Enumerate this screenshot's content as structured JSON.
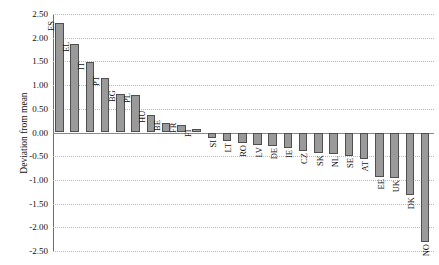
{
  "chart_data": {
    "type": "bar",
    "title": "",
    "xlabel": "",
    "ylabel": "Deviation from mean",
    "ylim": [
      -2.5,
      2.5
    ],
    "ytick_labels": [
      "2.50",
      "2.00",
      "1.50",
      "1.00",
      "0.50",
      "0.00",
      "-0.50",
      "-1.00",
      "-1.50",
      "-2.00",
      "-2.50"
    ],
    "ytick_values": [
      2.5,
      2.0,
      1.5,
      1.0,
      0.5,
      0.0,
      -0.5,
      -1.0,
      -1.5,
      -2.0,
      -2.5
    ],
    "grid": true,
    "legend": "none",
    "categories": [
      "ES",
      "EL",
      "IT",
      "PT",
      "BG",
      "PL",
      "HU",
      "BE",
      "FR",
      "FI",
      "SI",
      "LT",
      "RO",
      "LV",
      "DE",
      "IE",
      "CZ",
      "SK",
      "NL",
      "SE",
      "AT",
      "EE",
      "UK",
      "DK",
      "NO"
    ],
    "values": [
      2.32,
      1.87,
      1.49,
      1.16,
      0.81,
      0.8,
      0.36,
      0.19,
      0.16,
      0.08,
      -0.11,
      -0.17,
      -0.23,
      -0.26,
      -0.28,
      -0.33,
      -0.4,
      -0.44,
      -0.46,
      -0.5,
      -0.56,
      -0.93,
      -0.96,
      -1.31,
      -2.3
    ]
  },
  "colors": {
    "bar_fill": "#9a9a9a",
    "bar_border": "#4f4f4f",
    "gridline": "#b9b9b9",
    "axis": "#6d6d6d",
    "text": "#111111"
  }
}
